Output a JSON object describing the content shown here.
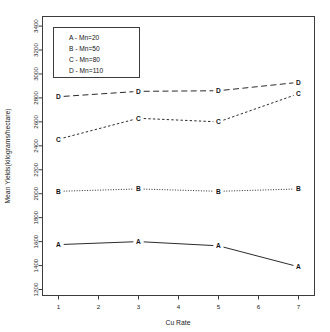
{
  "chart_data": {
    "type": "line",
    "title": "",
    "subtitle": "",
    "xlabel": "Cu Rate",
    "ylabel": "Mean Yields(kilograms/hectare)",
    "x": [
      1,
      3,
      5,
      7
    ],
    "xlim": [
      0.6,
      7.4
    ],
    "ylim": [
      1150,
      3480
    ],
    "xticks": [
      1,
      2,
      3,
      4,
      5,
      6,
      7
    ],
    "xticklabels": [
      "1",
      "2",
      "3",
      "4",
      "5",
      "6",
      "7"
    ],
    "yticks": [
      1200,
      1400,
      1600,
      1800,
      2000,
      2200,
      2400,
      2600,
      2800,
      3000,
      3200,
      3400
    ],
    "yticklabels": [
      "1200",
      "1400",
      "1600",
      "1800",
      "2000",
      "2200",
      "2400",
      "2600",
      "2800",
      "3000",
      "3200",
      "3400"
    ],
    "grid": false,
    "legend_position": "top-left",
    "point_markers": "letter",
    "series": [
      {
        "name": "A",
        "label": "A - Mn=20",
        "legend_key": "A",
        "mn": 20,
        "linestyle": "solid",
        "color": "#2b2b2b",
        "values": [
          1575,
          1600,
          1565,
          1390
        ]
      },
      {
        "name": "B",
        "label": "B - Mn=50",
        "legend_key": "B",
        "mn": 50,
        "linestyle": "dotted",
        "color": "#2b2b2b",
        "values": [
          2020,
          2040,
          2020,
          2040
        ]
      },
      {
        "name": "C",
        "label": "C - Mn=80",
        "legend_key": "C",
        "mn": 80,
        "linestyle": "short-dash",
        "color": "#2b2b2b",
        "values": [
          2455,
          2630,
          2600,
          2835
        ]
      },
      {
        "name": "D",
        "label": "D - Mn=110",
        "legend_key": "D",
        "mn": 110,
        "linestyle": "long-dash",
        "color": "#2b2b2b",
        "values": [
          2810,
          2855,
          2860,
          2930
        ]
      }
    ]
  },
  "legend": {
    "entries": [
      "A - Mn=20",
      "B - Mn=50",
      "C - Mn=80",
      "D - Mn=110"
    ]
  },
  "axes": {
    "x_title": "Cu Rate",
    "y_title": "Mean Yields(kilograms/hectare)"
  },
  "colors": {
    "axis": "#3c3c3c",
    "data": "#2b2b2b",
    "text": "#141414",
    "background": "#ffffff"
  }
}
